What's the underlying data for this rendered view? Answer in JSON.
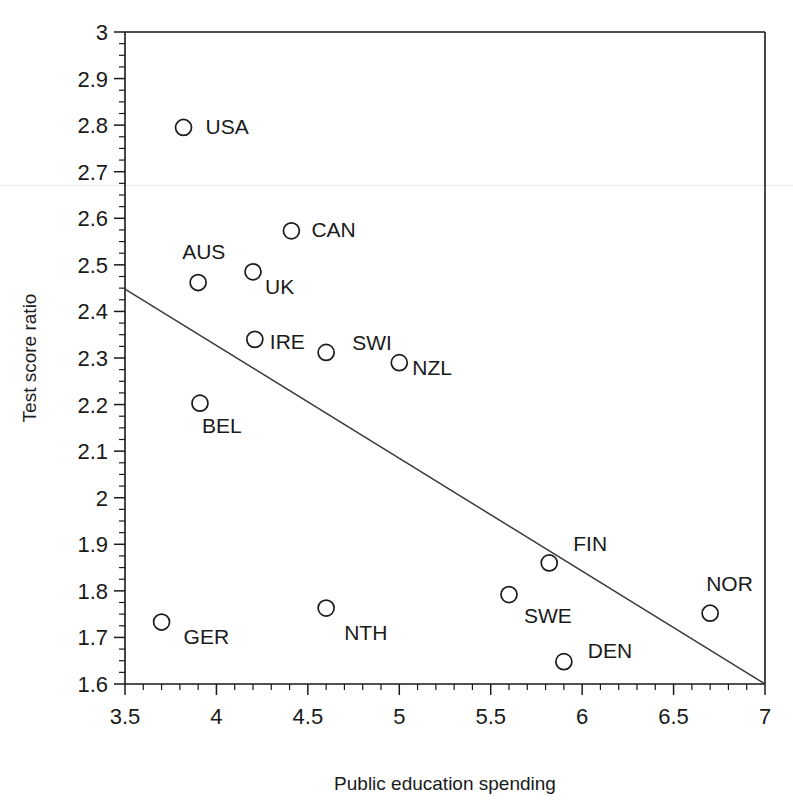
{
  "chart_data": {
    "type": "scatter",
    "title": "",
    "xlabel": "Public education spending",
    "ylabel": "Test score ratio",
    "xlim": [
      3.5,
      7
    ],
    "ylim": [
      1.6,
      3
    ],
    "grid": false,
    "legend": null,
    "xticks": [
      "3.5",
      "4",
      "4.5",
      "5",
      "5.5",
      "6",
      "6.5",
      "7"
    ],
    "xtick_values": [
      3.5,
      4,
      4.5,
      5,
      5.5,
      6,
      6.5,
      7
    ],
    "x_minor_step": 0.1,
    "yticks": [
      "1.6",
      "1.7",
      "1.8",
      "1.9",
      "2",
      "2.1",
      "2.2",
      "2.3",
      "2.4",
      "2.5",
      "2.6",
      "2.7",
      "2.8",
      "2.9",
      "3"
    ],
    "ytick_values": [
      1.6,
      1.7,
      1.8,
      1.9,
      2.0,
      2.1,
      2.2,
      2.3,
      2.4,
      2.5,
      2.6,
      2.7,
      2.8,
      2.9,
      3.0
    ],
    "y_minor_step": 0.025,
    "marker": "open-circle",
    "points": [
      {
        "label": "USA",
        "x": 3.82,
        "y": 2.795,
        "label_dx": 22,
        "label_dy": 7
      },
      {
        "label": "CAN",
        "x": 4.41,
        "y": 2.573,
        "label_dx": 20,
        "label_dy": 6
      },
      {
        "label": "AUS",
        "x": 3.9,
        "y": 2.462,
        "label_dx": -16,
        "label_dy": -24
      },
      {
        "label": "UK",
        "x": 4.2,
        "y": 2.485,
        "label_dx": 12,
        "label_dy": 22
      },
      {
        "label": "IRE",
        "x": 4.21,
        "y": 2.34,
        "label_dx": 15,
        "label_dy": 10
      },
      {
        "label": "SWI",
        "x": 4.6,
        "y": 2.312,
        "label_dx": 26,
        "label_dy": -2
      },
      {
        "label": "NZL",
        "x": 5.0,
        "y": 2.29,
        "label_dx": 13,
        "label_dy": 12
      },
      {
        "label": "BEL",
        "x": 3.91,
        "y": 2.203,
        "label_dx": 2,
        "label_dy": 30
      },
      {
        "label": "FIN",
        "x": 5.82,
        "y": 1.86,
        "label_dx": 24,
        "label_dy": -12
      },
      {
        "label": "SWE",
        "x": 5.6,
        "y": 1.792,
        "label_dx": 15,
        "label_dy": 28
      },
      {
        "label": "NOR",
        "x": 6.7,
        "y": 1.752,
        "label_dx": -4,
        "label_dy": -22
      },
      {
        "label": "DEN",
        "x": 5.9,
        "y": 1.648,
        "label_dx": 24,
        "label_dy": -4
      },
      {
        "label": "GER",
        "x": 3.7,
        "y": 1.733,
        "label_dx": 22,
        "label_dy": 22
      },
      {
        "label": "NTH",
        "x": 4.6,
        "y": 1.763,
        "label_dx": 18,
        "label_dy": 32
      }
    ],
    "trendline": {
      "name": "fitted-regression-line",
      "x0": 3.5,
      "y0": 2.448,
      "x1": 7.0,
      "y1": 1.6
    },
    "colors": {
      "axis": "#1a1a1a",
      "marker": "#1a1a1a",
      "trendline": "#3a3a3a",
      "background": "#ffffff"
    }
  }
}
